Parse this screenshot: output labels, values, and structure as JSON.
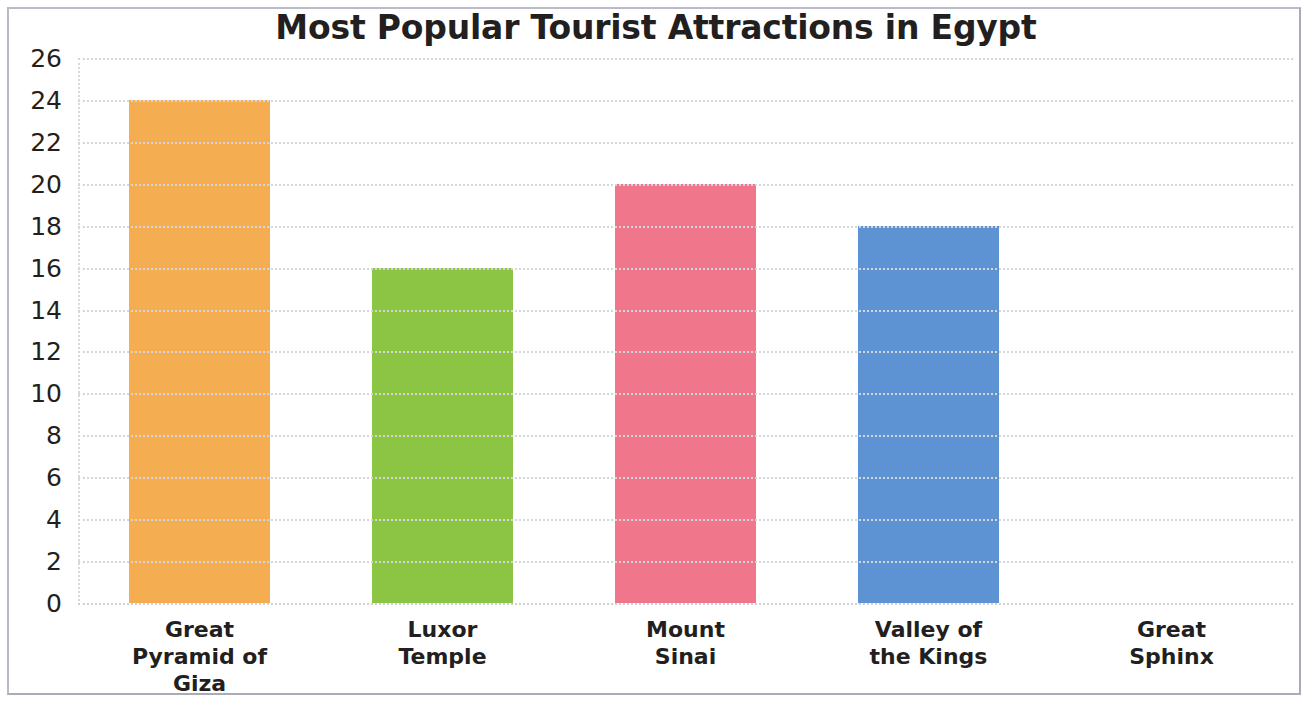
{
  "chart_data": {
    "type": "bar",
    "title": "Most Popular Tourist Attractions in Egypt",
    "xlabel": "",
    "ylabel": "",
    "categories": [
      "Great\nPyramid of\nGiza",
      "Luxor\nTemple",
      "Mount\nSinai",
      "Valley of\nthe Kings",
      "Great\nSphinx"
    ],
    "values": [
      24,
      16,
      20,
      18,
      0
    ],
    "bar_colors": [
      "#f5ad52",
      "#8cc543",
      "#f0768b",
      "#5e93d3",
      "#f5ad52"
    ],
    "ylim": [
      0,
      26
    ],
    "ytick_step": 2,
    "yticks": [
      0,
      2,
      4,
      6,
      8,
      10,
      12,
      14,
      16,
      18,
      20,
      22,
      24,
      26
    ],
    "ytick_labels": [
      "0",
      "2",
      "4",
      "6",
      "8",
      "10",
      "12",
      "14",
      "16",
      "18",
      "20",
      "22",
      "24",
      "26"
    ],
    "grid": true,
    "grid_color": "#d6d6d8",
    "grid_style": "dotted",
    "legend": false,
    "legend_position": "none",
    "background": "#ffffff",
    "title_color": "#231f20",
    "tick_label_color": "#231f20"
  }
}
